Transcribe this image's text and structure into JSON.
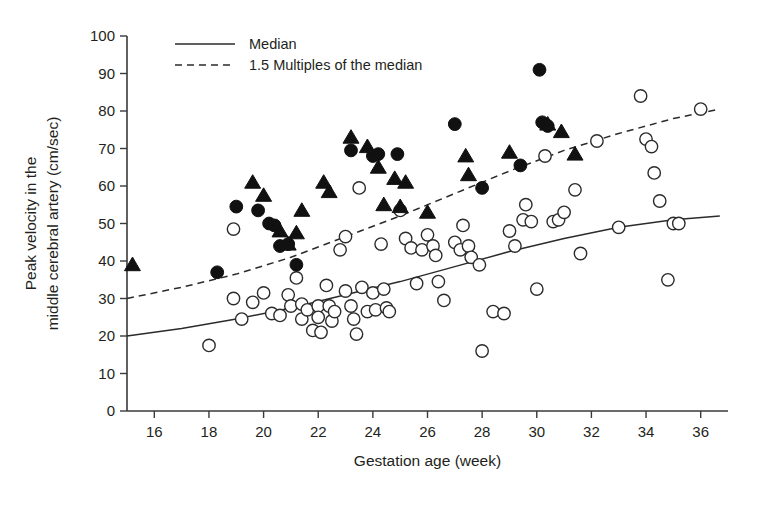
{
  "chart_data": {
    "type": "scatter",
    "title": "",
    "xlabel": "Gestation age (week)",
    "ylabel_line1": "Peak velocity in the",
    "ylabel_line2": "middle cerebral artery (cm/sec)",
    "xlim": [
      15,
      37
    ],
    "ylim": [
      0,
      100
    ],
    "xticks": [
      16,
      18,
      20,
      22,
      24,
      26,
      28,
      30,
      32,
      34,
      36
    ],
    "yticks": [
      0,
      10,
      20,
      30,
      40,
      50,
      60,
      70,
      80,
      90,
      100
    ],
    "grid": false,
    "legend_position": "top-left",
    "legend": [
      {
        "label": "Median",
        "style": "solid-line",
        "color": "#2b2b2b"
      },
      {
        "label": "1.5 Multiples of the median",
        "style": "dashed-line",
        "color": "#2b2b2b"
      }
    ],
    "series": [
      {
        "name": "open-circles",
        "marker": "open circle",
        "color": "#ffffff",
        "edge_color": "#2b2b2b",
        "points": [
          [
            18.0,
            17.5
          ],
          [
            18.9,
            48.5
          ],
          [
            18.9,
            30.0
          ],
          [
            19.2,
            24.5
          ],
          [
            19.6,
            29.0
          ],
          [
            20.0,
            31.5
          ],
          [
            20.3,
            26.0
          ],
          [
            20.6,
            25.5
          ],
          [
            20.9,
            31.0
          ],
          [
            21.0,
            28.0
          ],
          [
            21.2,
            35.5
          ],
          [
            21.4,
            28.5
          ],
          [
            21.4,
            24.5
          ],
          [
            21.6,
            27.0
          ],
          [
            21.8,
            21.5
          ],
          [
            22.0,
            28.0
          ],
          [
            22.0,
            25.0
          ],
          [
            22.1,
            21.0
          ],
          [
            22.3,
            33.5
          ],
          [
            22.4,
            28.0
          ],
          [
            22.5,
            24.0
          ],
          [
            22.6,
            26.5
          ],
          [
            22.8,
            43.0
          ],
          [
            23.0,
            46.5
          ],
          [
            23.0,
            32.0
          ],
          [
            23.2,
            28.0
          ],
          [
            23.3,
            24.5
          ],
          [
            23.4,
            20.5
          ],
          [
            23.5,
            59.5
          ],
          [
            23.6,
            33.0
          ],
          [
            23.8,
            26.5
          ],
          [
            24.0,
            31.5
          ],
          [
            24.1,
            27.0
          ],
          [
            24.3,
            44.5
          ],
          [
            24.4,
            32.5
          ],
          [
            24.5,
            27.5
          ],
          [
            24.6,
            26.5
          ],
          [
            25.0,
            53.5
          ],
          [
            25.2,
            46.0
          ],
          [
            25.4,
            43.5
          ],
          [
            25.6,
            34.0
          ],
          [
            25.8,
            43.0
          ],
          [
            26.0,
            47.0
          ],
          [
            26.2,
            44.0
          ],
          [
            26.3,
            41.5
          ],
          [
            26.4,
            34.5
          ],
          [
            26.6,
            29.5
          ],
          [
            27.0,
            45.0
          ],
          [
            27.2,
            43.0
          ],
          [
            27.3,
            49.5
          ],
          [
            27.5,
            44.0
          ],
          [
            27.6,
            41.0
          ],
          [
            27.9,
            39.0
          ],
          [
            28.0,
            16.0
          ],
          [
            28.4,
            26.5
          ],
          [
            28.8,
            26.0
          ],
          [
            29.0,
            48.0
          ],
          [
            29.2,
            44.0
          ],
          [
            29.5,
            51.0
          ],
          [
            29.6,
            55.0
          ],
          [
            29.8,
            50.5
          ],
          [
            30.0,
            32.5
          ],
          [
            30.3,
            68.0
          ],
          [
            30.6,
            50.5
          ],
          [
            30.8,
            51.0
          ],
          [
            31.0,
            53.0
          ],
          [
            31.4,
            59.0
          ],
          [
            31.6,
            42.0
          ],
          [
            32.2,
            72.0
          ],
          [
            33.0,
            49.0
          ],
          [
            33.8,
            84.0
          ],
          [
            34.0,
            72.5
          ],
          [
            34.2,
            70.5
          ],
          [
            34.3,
            63.5
          ],
          [
            34.5,
            56.0
          ],
          [
            34.8,
            35.0
          ],
          [
            35.0,
            50.0
          ],
          [
            35.2,
            50.0
          ],
          [
            36.0,
            80.5
          ]
        ]
      },
      {
        "name": "filled-circles",
        "marker": "filled circle",
        "color": "#111111",
        "points": [
          [
            18.3,
            37.0
          ],
          [
            19.0,
            54.5
          ],
          [
            19.8,
            53.5
          ],
          [
            20.2,
            50.0
          ],
          [
            20.4,
            49.5
          ],
          [
            20.6,
            44.0
          ],
          [
            20.9,
            44.5
          ],
          [
            21.2,
            39.0
          ],
          [
            23.2,
            69.5
          ],
          [
            24.0,
            68.0
          ],
          [
            24.2,
            68.5
          ],
          [
            24.9,
            68.5
          ],
          [
            27.0,
            76.5
          ],
          [
            28.0,
            59.5
          ],
          [
            29.4,
            65.5
          ],
          [
            30.1,
            91.0
          ],
          [
            30.2,
            77.0
          ],
          [
            30.4,
            76.0
          ]
        ]
      },
      {
        "name": "filled-triangles",
        "marker": "filled triangle",
        "color": "#111111",
        "points": [
          [
            15.2,
            39.0
          ],
          [
            19.6,
            61.0
          ],
          [
            20.0,
            57.5
          ],
          [
            20.6,
            48.0
          ],
          [
            20.9,
            44.5
          ],
          [
            21.2,
            47.5
          ],
          [
            21.4,
            53.5
          ],
          [
            22.2,
            61.0
          ],
          [
            22.4,
            58.5
          ],
          [
            23.2,
            73.0
          ],
          [
            23.8,
            70.5
          ],
          [
            24.2,
            65.0
          ],
          [
            24.4,
            55.0
          ],
          [
            24.8,
            62.0
          ],
          [
            25.0,
            54.5
          ],
          [
            25.2,
            61.0
          ],
          [
            26.0,
            53.0
          ],
          [
            27.4,
            68.0
          ],
          [
            27.5,
            63.0
          ],
          [
            29.0,
            69.0
          ],
          [
            30.4,
            76.5
          ],
          [
            30.9,
            74.5
          ],
          [
            31.4,
            68.5
          ]
        ]
      }
    ],
    "curves": [
      {
        "name": "median",
        "style": "solid",
        "points": [
          [
            15.0,
            20.0
          ],
          [
            17.0,
            22.0
          ],
          [
            19.0,
            24.5
          ],
          [
            21.0,
            27.5
          ],
          [
            23.0,
            31.0
          ],
          [
            25.0,
            34.5
          ],
          [
            27.0,
            38.5
          ],
          [
            29.0,
            42.5
          ],
          [
            31.0,
            46.0
          ],
          [
            33.0,
            49.0
          ],
          [
            35.0,
            51.0
          ],
          [
            36.7,
            52.0
          ]
        ]
      },
      {
        "name": "mom-1-5",
        "style": "dashed",
        "points": [
          [
            15.0,
            30.0
          ],
          [
            17.0,
            33.0
          ],
          [
            19.0,
            36.5
          ],
          [
            21.0,
            41.0
          ],
          [
            23.0,
            46.5
          ],
          [
            25.0,
            52.0
          ],
          [
            27.0,
            58.0
          ],
          [
            29.0,
            64.0
          ],
          [
            31.0,
            69.5
          ],
          [
            33.0,
            74.0
          ],
          [
            35.0,
            78.0
          ],
          [
            36.7,
            80.5
          ]
        ]
      }
    ]
  }
}
